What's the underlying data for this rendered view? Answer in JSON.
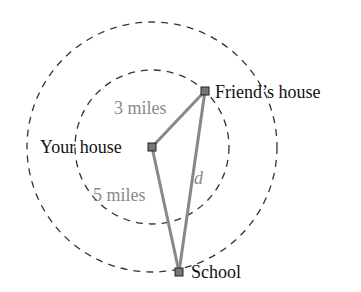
{
  "diagram": {
    "points": {
      "your_house": {
        "label": "Your house",
        "x": 152,
        "y": 147
      },
      "friends_house": {
        "label": "Friend’s house",
        "x": 205,
        "y": 91
      },
      "school": {
        "label": "School",
        "x": 179,
        "y": 272
      }
    },
    "circles": [
      {
        "name": "inner",
        "radius_label": "3 miles",
        "r": 77
      },
      {
        "name": "outer",
        "radius_label": "5 miles",
        "r": 125
      }
    ],
    "segments": {
      "your_to_friend": {
        "label": "3 miles"
      },
      "your_to_school": {
        "label": "5 miles"
      },
      "friend_to_school": {
        "label": "d"
      }
    },
    "colors": {
      "segment": "#888888",
      "segment_label": "#8a8a8a",
      "circle": "#333333",
      "text": "#111111",
      "marker_fill": "#777777"
    }
  }
}
